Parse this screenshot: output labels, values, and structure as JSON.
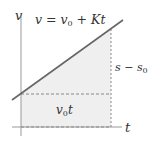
{
  "diagram": {
    "axes": {
      "y_label": "v",
      "x_label": "t"
    },
    "line_label": {
      "lhs": "v",
      "eq": " = ",
      "v": "v",
      "sub0": "0",
      "plus": " + ",
      "kt": "Kt"
    },
    "area_label": {
      "v": "v",
      "sub0": "0",
      "t": "t"
    },
    "height_label": {
      "s": "s",
      "minus": " − ",
      "s2": "s",
      "sub0": "0"
    },
    "colors": {
      "line": "#666666",
      "axis": "#999999",
      "fill": "#efefef",
      "dash": "#888888",
      "text": "#333333"
    }
  }
}
